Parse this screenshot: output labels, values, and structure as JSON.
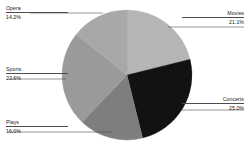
{
  "chart_data": {
    "type": "pie",
    "title": "",
    "subtitle": "",
    "xlabel": "",
    "ylabel": "",
    "legend_position": "none",
    "grid": false,
    "labels_format": "category name above percentage, joined by leader line to slice",
    "start_angle_deg": 0,
    "direction": "clockwise",
    "center": {
      "x": 127,
      "y": 75
    },
    "radius": 65,
    "categories": [
      "Movies",
      "Concerts",
      "Plays",
      "Sports",
      "Opera"
    ],
    "values": [
      21.1,
      25.0,
      16.0,
      23.6,
      14.2
    ],
    "slices": [
      {
        "name": "Movies",
        "label": "Movies",
        "percent_text": "21.1%",
        "value": 21.1,
        "color": "#b5b5b5",
        "start_angle_deg": 0.0,
        "end_angle_deg": 75.96,
        "label_side": "right"
      },
      {
        "name": "Concerts",
        "label": "Concerts",
        "percent_text": "25.0%",
        "value": 25.0,
        "color": "#121212",
        "start_angle_deg": 75.96,
        "end_angle_deg": 165.96,
        "label_side": "right"
      },
      {
        "name": "Plays",
        "label": "Plays",
        "percent_text": "16.0%",
        "value": 16.0,
        "color": "#7e7e7e",
        "start_angle_deg": 165.96,
        "end_angle_deg": 223.56,
        "label_side": "left"
      },
      {
        "name": "Sports",
        "label": "Sports",
        "percent_text": "23.6%",
        "value": 23.6,
        "color": "#9a9a9a",
        "start_angle_deg": 223.56,
        "end_angle_deg": 308.52,
        "label_side": "left"
      },
      {
        "name": "Opera",
        "label": "Opera",
        "percent_text": "14.2%",
        "value": 14.2,
        "color": "#a8a8a8",
        "start_angle_deg": 308.52,
        "end_angle_deg": 359.64,
        "label_side": "left"
      }
    ],
    "colors": {
      "movies": "#b5b5b5",
      "concerts": "#121212",
      "plays": "#7e7e7e",
      "sports": "#9a9a9a",
      "opera": "#a8a8a8",
      "background": "#ffffff",
      "leader_line": "#4d4d4d",
      "text": "#1a1a1a"
    }
  },
  "labels": {
    "opera": {
      "name": "Opera",
      "percent": "14.2%"
    },
    "movies": {
      "name": "Movies",
      "percent": "21.1%"
    },
    "concerts": {
      "name": "Concerts",
      "percent": "25.0%"
    },
    "sports": {
      "name": "Sports",
      "percent": "23.6%"
    },
    "plays": {
      "name": "Plays",
      "percent": "16.0%"
    }
  }
}
